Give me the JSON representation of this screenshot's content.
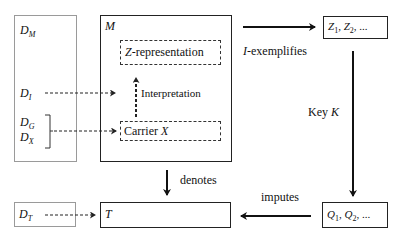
{
  "diagram": {
    "d_box": {
      "dm": {
        "main": "D",
        "sub": "M"
      },
      "di": {
        "main": "D",
        "sub": "I"
      },
      "dg": {
        "main": "D",
        "sub": "G"
      },
      "dx": {
        "main": "D",
        "sub": "X"
      }
    },
    "m_box": {
      "title": "M",
      "z_representation": {
        "italic": "Z",
        "rest": "-representation"
      },
      "interpretation_label": "Interpretation",
      "carrier": {
        "text": "Carrier ",
        "italic": "X"
      }
    },
    "z_box": {
      "parts": [
        {
          "main": "Z",
          "sub": "1"
        },
        {
          "main": "Z",
          "sub": "2"
        }
      ],
      "ellipsis": "..."
    },
    "q_box": {
      "parts": [
        {
          "main": "Q",
          "sub": "1"
        },
        {
          "main": "Q",
          "sub": "2"
        }
      ],
      "ellipsis": "..."
    },
    "dt_box": {
      "main": "D",
      "sub": "T"
    },
    "t_box": {
      "title": "T"
    },
    "arrows": {
      "exemplifies": {
        "italic": "I",
        "rest": "-exemplifies"
      },
      "key": {
        "text": "Key ",
        "italic": "K"
      },
      "imputes": "imputes",
      "denotes": "denotes"
    },
    "colors": {
      "stroke": "#222222",
      "light_border": "#9a9a9a",
      "background": "#ffffff"
    }
  }
}
